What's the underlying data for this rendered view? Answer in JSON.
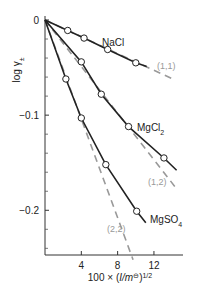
{
  "chart_data": {
    "type": "line",
    "title": "",
    "xlabel": "100 × (I/m⊖)^1/2",
    "xlabel_parts": {
      "prefix": "100 × (",
      "I": "I",
      "slash": "/",
      "m": "m",
      "std": "⊖",
      "close": ")",
      "exp": "1/2"
    },
    "ylabel": "log γ±",
    "ylabel_parts": {
      "log": "log γ",
      "sub": "±"
    },
    "xlim": [
      0,
      15.2
    ],
    "ylim": [
      -0.247,
      0
    ],
    "x_ticks": [
      4,
      8,
      12
    ],
    "x_tick_labels": [
      "4",
      "8",
      "12"
    ],
    "y_ticks_major": [
      0,
      -0.1,
      -0.2
    ],
    "y_tick_labels": [
      "0",
      "−0.1",
      "−0.2"
    ],
    "y_ticks_minor": [
      -0.02,
      -0.04,
      -0.06,
      -0.08,
      -0.12,
      -0.14,
      -0.16,
      -0.18,
      -0.22,
      -0.24
    ],
    "grid": false,
    "series": [
      {
        "name": "NaCl",
        "label": "NaCl",
        "style": "solid-with-markers",
        "color": "#222222",
        "points": [
          [
            2.5,
            -0.011
          ],
          [
            4.3,
            -0.019
          ],
          [
            6.9,
            -0.031
          ],
          [
            10.0,
            -0.045
          ]
        ],
        "curve": [
          [
            0,
            0
          ],
          [
            2.5,
            -0.011
          ],
          [
            4.3,
            -0.019
          ],
          [
            6.9,
            -0.031
          ],
          [
            10.0,
            -0.045
          ],
          [
            11.2,
            -0.049
          ]
        ]
      },
      {
        "name": "MgCl2",
        "label": "MgCl",
        "label_sub": "2",
        "style": "solid-with-markers",
        "color": "#222222",
        "points": [
          [
            4.0,
            -0.044
          ],
          [
            6.2,
            -0.078
          ],
          [
            9.2,
            -0.112
          ],
          [
            13.1,
            -0.145
          ]
        ],
        "curve": [
          [
            0,
            0
          ],
          [
            4.0,
            -0.044
          ],
          [
            6.2,
            -0.078
          ],
          [
            9.2,
            -0.112
          ],
          [
            13.1,
            -0.145
          ],
          [
            14.5,
            -0.158
          ]
        ]
      },
      {
        "name": "MgSO4",
        "label": "MgSO",
        "label_sub": "4",
        "style": "solid-with-markers",
        "color": "#222222",
        "points": [
          [
            2.3,
            -0.062
          ],
          [
            4.0,
            -0.103
          ],
          [
            6.7,
            -0.152
          ],
          [
            10.1,
            -0.201
          ]
        ],
        "curve": [
          [
            0,
            0
          ],
          [
            2.3,
            -0.062
          ],
          [
            4.0,
            -0.103
          ],
          [
            6.7,
            -0.152
          ],
          [
            10.1,
            -0.201
          ],
          [
            11.1,
            -0.213
          ]
        ]
      }
    ],
    "limiting_lines": [
      {
        "name": "(1,1)",
        "label": "(1,1)",
        "style": "dashed",
        "color": "#999999",
        "from": [
          0,
          0
        ],
        "to": [
          14.3,
          -0.063
        ]
      },
      {
        "name": "(1,2)",
        "label": "(1,2)",
        "style": "dashed",
        "color": "#999999",
        "from": [
          0,
          0
        ],
        "to": [
          14.3,
          -0.175
        ]
      },
      {
        "name": "(2,2)",
        "label": "(2,2)",
        "style": "dashed",
        "color": "#999999",
        "from": [
          0,
          0
        ],
        "to": [
          9.7,
          -0.252
        ]
      }
    ]
  }
}
